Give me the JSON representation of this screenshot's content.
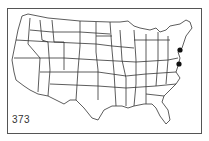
{
  "map": {
    "title": "United States (contiguous) outline map with state boundaries",
    "figure_number": "373",
    "markers": [
      {
        "label": "marker-northeast-1",
        "x": 180,
        "y": 50,
        "region": "New York / Connecticut area"
      },
      {
        "label": "marker-northeast-2",
        "x": 179,
        "y": 64,
        "region": "New Jersey / Delaware area"
      }
    ],
    "colors": {
      "lines": "#333333",
      "marker": "#111111",
      "background": "#ffffff"
    }
  }
}
